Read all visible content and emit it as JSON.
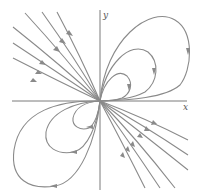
{
  "diagram": {
    "type": "phase-portrait",
    "axes": {
      "x_label": "x",
      "y_label": "y"
    },
    "colors": {
      "axis": "#7a7a7a",
      "trajectory": "#8a8a8a",
      "label": "#555555"
    }
  }
}
